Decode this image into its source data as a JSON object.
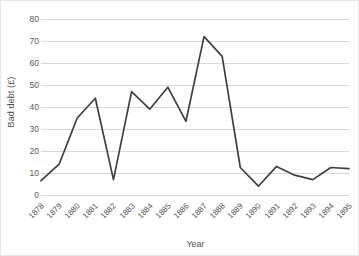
{
  "chart_data": {
    "type": "line",
    "title": "",
    "xlabel": "Year",
    "ylabel": "Bad debt (£)",
    "categories": [
      "1878",
      "1879",
      "1880",
      "1881",
      "1882",
      "1883",
      "1884",
      "1885",
      "1886",
      "1887",
      "1888",
      "1889",
      "1890",
      "1891",
      "1892",
      "1893",
      "1894",
      "1895"
    ],
    "values": [
      6.5,
      14,
      35,
      44,
      7,
      47,
      39,
      49,
      33.5,
      72,
      63,
      12.5,
      4,
      13,
      9,
      7,
      12.5,
      12
    ],
    "series": [
      {
        "name": "Bad debt",
        "color": "#404040",
        "values": [
          6.5,
          14,
          35,
          44,
          7,
          47,
          39,
          49,
          33.5,
          72,
          63,
          12.5,
          4,
          13,
          9,
          7,
          12.5,
          12
        ]
      }
    ],
    "ylim": [
      0,
      80
    ],
    "ytick_values": [
      0,
      10,
      20,
      30,
      40,
      50,
      60,
      70,
      80
    ],
    "ytick_labels": [
      "0",
      "10",
      "20",
      "30",
      "40",
      "50",
      "60",
      "70",
      "80"
    ],
    "grid": true,
    "grid_axis": "y",
    "legend": false,
    "legend_position": "none",
    "line_color": "#404040",
    "grid_color": "#d9d9d9",
    "axis_text_color": "#595959",
    "title_text_color": "#4d4d4d",
    "background_color": "#ffffff",
    "border_color": "#e6e6e6"
  }
}
